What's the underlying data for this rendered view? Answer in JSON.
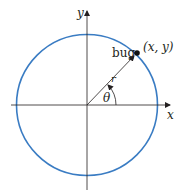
{
  "diagram": {
    "axes": {
      "x_label": "x",
      "y_label": "y"
    },
    "circle": {
      "color": "#3a7cc3"
    },
    "point": {
      "label": "bug",
      "coord_label": "(x, y)"
    },
    "radius_label": "r",
    "angle_label": "θ"
  }
}
